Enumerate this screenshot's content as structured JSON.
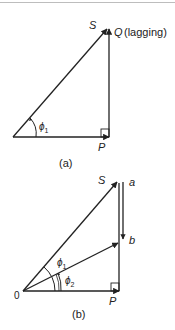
{
  "diagram_a": {
    "caption": "(a)",
    "labels": {
      "S": "S",
      "Q": "Q",
      "Q_note": "(lagging)",
      "P": "P",
      "phi": "ϕ",
      "phi_sub": "1"
    }
  },
  "diagram_b": {
    "caption": "(b)",
    "labels": {
      "S": "S",
      "a": "a",
      "b": "b",
      "origin": "0",
      "P": "P",
      "phi1": "ϕ",
      "phi1_sub": "1",
      "phi2": "ϕ",
      "phi2_sub": "2"
    }
  },
  "colors": {
    "line": "#222222",
    "text": "#222222",
    "background": "#ffffff"
  }
}
